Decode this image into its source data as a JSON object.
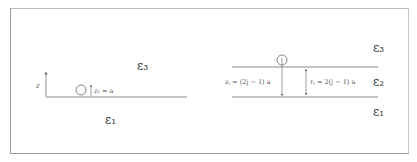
{
  "left_panel": {
    "axis_label": "z",
    "height_label": "z₁ = a",
    "region_above": "ε₃",
    "region_below": "ε₁"
  },
  "right_panel": {
    "position_label": "zⱼ = (2j − 1) a",
    "spacing_label": "ℓⱼ = 2(j − 1) a",
    "region_top": "ε₃",
    "region_middle": "ε₂",
    "region_bottom": "ε₁"
  },
  "colors": {
    "line": "#8a8a8a",
    "text": "#444444",
    "border": "#9a9a9a"
  }
}
